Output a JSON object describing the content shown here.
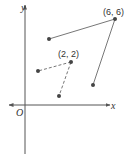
{
  "diagram": {
    "axes": {
      "x_label": "x",
      "y_label": "y",
      "origin_label": "O"
    },
    "labels": {
      "point_a": "(6, 6)",
      "point_b": "(2, 2)"
    },
    "colors": {
      "axis": "#555555",
      "line": "#777777",
      "point": "#444444",
      "text": "#333333"
    },
    "segments": [
      {
        "style": "solid",
        "from": "(6, 6)",
        "to": "unlabeled point upper-left"
      },
      {
        "style": "solid",
        "from": "(6, 6)",
        "to": "unlabeled point lower-right"
      },
      {
        "style": "dashed",
        "from": "(2, 2)",
        "to": "unlabeled point left"
      },
      {
        "style": "dashed",
        "from": "(2, 2)",
        "to": "unlabeled point below"
      }
    ]
  }
}
